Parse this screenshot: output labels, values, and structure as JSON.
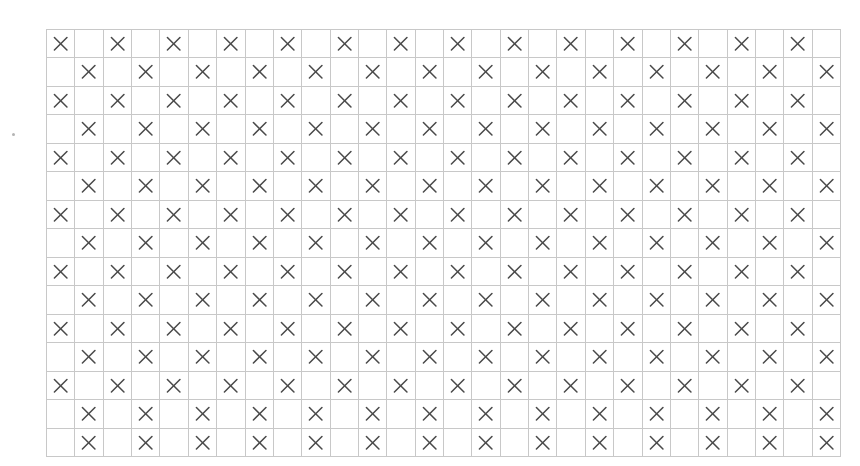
{
  "figure": {
    "kind": "cellular-automaton-grid",
    "rows": 15,
    "cols": 28,
    "cell_mark": "×",
    "colors": {
      "dark_cell": "#3e3e3e",
      "light_cell": "#d9d9d9",
      "empty_cell": "#ffffff",
      "grid_line": "#c8c8c8",
      "mark_color": "#4a4a4a",
      "background": "#ffffff"
    },
    "legend": {
      "dark": "filled / on cell",
      "light": "highlighted seed cell",
      "mark": "x marker cell",
      "empty": "blank cell"
    }
  },
  "chart_data": {
    "type": "heatmap",
    "title": "",
    "xlabel": "",
    "ylabel": "",
    "rows": 15,
    "cols": 28,
    "legend_position": "none",
    "grid": true,
    "value_codes": {
      "0": "empty",
      "1": "x-mark",
      "2": "dark-filled",
      "3": "light-highlight"
    },
    "cells": [
      [
        1,
        0,
        1,
        0,
        1,
        0,
        1,
        0,
        1,
        0,
        1,
        0,
        1,
        0,
        1,
        3,
        1,
        0,
        1,
        0,
        1,
        0,
        1,
        0,
        1,
        0,
        1,
        0
      ],
      [
        0,
        1,
        0,
        1,
        0,
        1,
        0,
        1,
        0,
        1,
        0,
        1,
        0,
        1,
        2,
        1,
        2,
        1,
        0,
        1,
        0,
        1,
        0,
        1,
        0,
        1,
        0,
        1
      ],
      [
        1,
        0,
        1,
        0,
        1,
        0,
        1,
        0,
        1,
        0,
        1,
        0,
        1,
        2,
        1,
        0,
        1,
        2,
        1,
        0,
        1,
        0,
        1,
        0,
        1,
        0,
        1,
        0
      ],
      [
        0,
        1,
        0,
        1,
        0,
        1,
        0,
        1,
        0,
        1,
        0,
        1,
        2,
        1,
        2,
        1,
        2,
        1,
        2,
        1,
        0,
        1,
        0,
        1,
        0,
        1,
        0,
        1
      ],
      [
        1,
        0,
        1,
        0,
        1,
        0,
        1,
        0,
        1,
        0,
        1,
        2,
        1,
        0,
        1,
        0,
        1,
        0,
        1,
        2,
        1,
        0,
        1,
        0,
        1,
        0,
        1,
        0
      ],
      [
        0,
        1,
        0,
        1,
        0,
        1,
        0,
        1,
        0,
        1,
        2,
        1,
        2,
        1,
        0,
        1,
        0,
        1,
        2,
        1,
        2,
        1,
        0,
        1,
        0,
        1,
        0,
        1
      ],
      [
        1,
        0,
        1,
        0,
        1,
        0,
        1,
        0,
        1,
        2,
        1,
        0,
        1,
        2,
        1,
        0,
        1,
        2,
        1,
        0,
        1,
        2,
        1,
        0,
        1,
        0,
        1,
        0
      ],
      [
        0,
        1,
        0,
        1,
        0,
        1,
        0,
        1,
        2,
        1,
        2,
        1,
        2,
        1,
        2,
        1,
        2,
        1,
        2,
        1,
        2,
        1,
        2,
        1,
        0,
        1,
        0,
        1
      ],
      [
        1,
        0,
        1,
        0,
        1,
        0,
        1,
        2,
        1,
        0,
        1,
        0,
        1,
        0,
        1,
        0,
        1,
        0,
        1,
        0,
        1,
        0,
        1,
        2,
        1,
        0,
        1,
        0
      ],
      [
        0,
        1,
        0,
        1,
        0,
        1,
        2,
        1,
        2,
        1,
        0,
        1,
        0,
        1,
        0,
        1,
        0,
        1,
        0,
        1,
        0,
        1,
        2,
        1,
        2,
        1,
        0,
        1
      ],
      [
        1,
        0,
        1,
        0,
        1,
        2,
        1,
        0,
        1,
        2,
        1,
        0,
        1,
        0,
        1,
        0,
        1,
        0,
        1,
        0,
        1,
        2,
        1,
        0,
        1,
        2,
        1,
        0
      ],
      [
        0,
        1,
        0,
        1,
        2,
        1,
        2,
        1,
        2,
        1,
        2,
        1,
        0,
        1,
        0,
        1,
        0,
        1,
        0,
        1,
        2,
        1,
        2,
        1,
        2,
        1,
        2,
        1
      ],
      [
        1,
        0,
        1,
        2,
        1,
        0,
        1,
        0,
        1,
        0,
        1,
        2,
        1,
        0,
        1,
        0,
        1,
        0,
        1,
        2,
        1,
        0,
        1,
        0,
        1,
        0,
        1,
        2
      ],
      [
        0,
        1,
        2,
        1,
        2,
        1,
        0,
        1,
        0,
        1,
        2,
        1,
        2,
        1,
        0,
        1,
        2,
        1,
        2,
        1,
        0,
        1,
        0,
        1,
        2,
        1,
        2,
        1
      ],
      [
        2,
        1,
        0,
        1,
        2,
        1,
        2,
        1,
        2,
        1,
        0,
        1,
        2,
        1,
        0,
        1,
        2,
        1,
        0,
        1,
        2,
        1,
        2,
        1,
        2,
        1,
        0,
        1
      ]
    ]
  }
}
